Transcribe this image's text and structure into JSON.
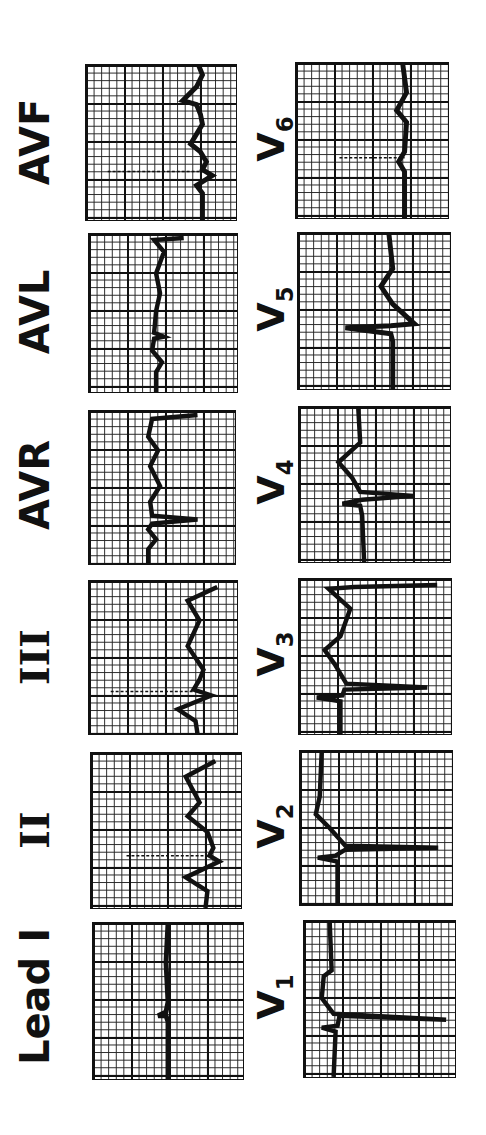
{
  "figure": {
    "limb_leads": [
      {
        "label": "AVF"
      },
      {
        "label": "AVL"
      },
      {
        "label": "AVR"
      },
      {
        "label": "III"
      },
      {
        "label": "II"
      },
      {
        "label": "Lead I"
      }
    ],
    "precordial_leads": [
      {
        "label": "V",
        "sub": "6"
      },
      {
        "label": "V",
        "sub": "5"
      },
      {
        "label": "V",
        "sub": "4"
      },
      {
        "label": "V",
        "sub": "3"
      },
      {
        "label": "V",
        "sub": "2"
      },
      {
        "label": "V",
        "sub": "1"
      }
    ]
  },
  "colors": {
    "ink": "#111111",
    "paper": "#ffffff"
  }
}
